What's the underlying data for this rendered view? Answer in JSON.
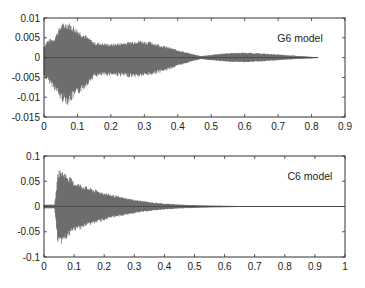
{
  "chart_data": [
    {
      "type": "line",
      "title": "",
      "annotation": "G6 model",
      "xlabel": "",
      "ylabel": "",
      "xlim": [
        0,
        0.9
      ],
      "ylim": [
        -0.015,
        0.01
      ],
      "xticks": [
        "0",
        "0.1",
        "0.2",
        "0.3",
        "0.4",
        "0.5",
        "0.6",
        "0.7",
        "0.8",
        "0.9"
      ],
      "yticks": [
        "0.01",
        "0.005",
        "0",
        "-0.005",
        "-0.01",
        "-0.015"
      ],
      "grid": false,
      "color": "#4a4a4a",
      "envelope": {
        "x": [
          0.0,
          0.01,
          0.03,
          0.05,
          0.07,
          0.09,
          0.12,
          0.15,
          0.2,
          0.25,
          0.28,
          0.32,
          0.36,
          0.4,
          0.44,
          0.47,
          0.5,
          0.55,
          0.6,
          0.65,
          0.7,
          0.75,
          0.8,
          0.82
        ],
        "upper": [
          0.003,
          0.0045,
          0.005,
          0.0085,
          0.0092,
          0.008,
          0.006,
          0.004,
          0.0035,
          0.004,
          0.0045,
          0.004,
          0.003,
          0.002,
          0.001,
          0.0004,
          0.0007,
          0.0012,
          0.0013,
          0.0011,
          0.0008,
          0.0005,
          0.0002,
          0.0
        ],
        "lower": [
          -0.005,
          -0.006,
          -0.008,
          -0.011,
          -0.012,
          -0.0105,
          -0.008,
          -0.005,
          -0.0045,
          -0.005,
          -0.005,
          -0.0045,
          -0.0035,
          -0.0022,
          -0.001,
          -0.0004,
          -0.0007,
          -0.0011,
          -0.0012,
          -0.001,
          -0.0007,
          -0.0004,
          -0.0002,
          0.0
        ]
      }
    },
    {
      "type": "line",
      "title": "",
      "annotation": "C6 model",
      "xlabel": "",
      "ylabel": "",
      "xlim": [
        0,
        1
      ],
      "ylim": [
        -0.1,
        0.1
      ],
      "xticks": [
        "0",
        "0.1",
        "0.2",
        "0.3",
        "0.4",
        "0.5",
        "0.6",
        "0.7",
        "0.8",
        "0.9",
        "1"
      ],
      "yticks": [
        "0.1",
        "0.05",
        "0",
        "-0.05",
        "-0.1"
      ],
      "grid": false,
      "color": "#4a4a4a",
      "envelope": {
        "x": [
          0.0,
          0.035,
          0.04,
          0.045,
          0.05,
          0.06,
          0.08,
          0.1,
          0.15,
          0.2,
          0.25,
          0.3,
          0.35,
          0.4,
          0.45,
          0.5,
          0.55,
          0.6,
          0.65,
          0.7,
          0.75,
          0.8,
          0.9,
          1.0
        ],
        "upper": [
          0.004,
          0.004,
          0.03,
          0.065,
          0.074,
          0.072,
          0.063,
          0.05,
          0.038,
          0.028,
          0.02,
          0.014,
          0.009,
          0.006,
          0.004,
          0.003,
          0.002,
          0.0015,
          0.001,
          0.0007,
          0.0005,
          0.0004,
          0.0002,
          0.0001
        ],
        "lower": [
          -0.004,
          -0.004,
          -0.035,
          -0.07,
          -0.078,
          -0.074,
          -0.062,
          -0.05,
          -0.038,
          -0.028,
          -0.02,
          -0.014,
          -0.009,
          -0.006,
          -0.004,
          -0.003,
          -0.002,
          -0.0015,
          -0.001,
          -0.0007,
          -0.0005,
          -0.0004,
          -0.0002,
          -0.0001
        ]
      }
    }
  ]
}
